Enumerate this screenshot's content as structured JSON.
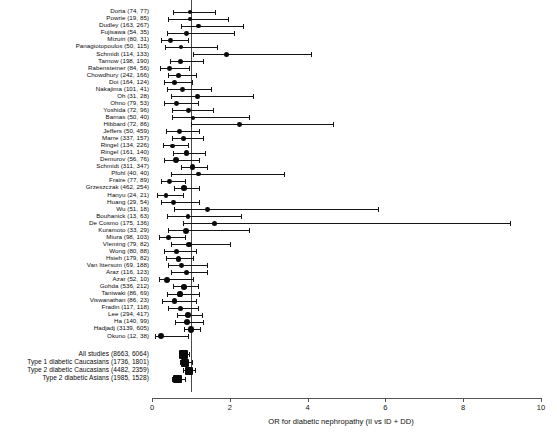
{
  "chart_data": {
    "type": "forest",
    "title": "",
    "xlabel": "OR for diabetic nephropathy (II vs ID + DD)",
    "ylabel": "",
    "xlim": [
      0,
      10
    ],
    "xticks": [
      0,
      2,
      4,
      6,
      8,
      10
    ],
    "xtick_labels": [
      "0",
      "2",
      "4",
      "6",
      "8",
      "10"
    ],
    "reference_line": 1,
    "grid": false,
    "legend": "none",
    "marker_shape": "filled-circle",
    "effect_measure": "Odds ratio",
    "studies": [
      {
        "label": "Dorta (74, 77)",
        "or": 0.98,
        "lcl": 0.55,
        "ucl": 1.62,
        "size": 2.2
      },
      {
        "label": "Powrie (19, 85)",
        "or": 0.97,
        "lcl": 0.42,
        "ucl": 1.95,
        "size": 2.2
      },
      {
        "label": "Dudley (163, 267)",
        "or": 1.2,
        "lcl": 0.74,
        "ucl": 2.35,
        "size": 2.4
      },
      {
        "label": "Fujisawa (54, 35)",
        "or": 0.88,
        "lcl": 0.38,
        "ucl": 2.1,
        "size": 2.4
      },
      {
        "label": "Mizuiri (80, 31)",
        "or": 0.48,
        "lcl": 0.22,
        "ucl": 0.92,
        "size": 2.4
      },
      {
        "label": "Panagiotopoulos (50, 115)",
        "or": 0.74,
        "lcl": 0.33,
        "ucl": 1.68,
        "size": 2.2
      },
      {
        "label": "Schmidt (114, 133)",
        "or": 1.92,
        "lcl": 1.06,
        "ucl": 4.1,
        "size": 2.6
      },
      {
        "label": "Tarnow (198, 190)",
        "or": 0.74,
        "lcl": 0.45,
        "ucl": 1.3,
        "size": 2.6
      },
      {
        "label": "Rabensteiner (84, 56)",
        "or": 0.45,
        "lcl": 0.21,
        "ucl": 0.96,
        "size": 2.4
      },
      {
        "label": "Chowdhury (242, 166)",
        "or": 0.68,
        "lcl": 0.42,
        "ucl": 1.12,
        "size": 2.6
      },
      {
        "label": "Doi (164, 124)",
        "or": 0.57,
        "lcl": 0.31,
        "ucl": 1.02,
        "size": 2.6
      },
      {
        "label": "Nakajima (101, 41)",
        "or": 0.78,
        "lcl": 0.38,
        "ucl": 1.52,
        "size": 2.4
      },
      {
        "label": "Oh (31, 28)",
        "or": 1.17,
        "lcl": 0.5,
        "ucl": 2.6,
        "size": 2.2
      },
      {
        "label": "Ohno (79, 53)",
        "or": 0.62,
        "lcl": 0.3,
        "ucl": 1.18,
        "size": 2.4
      },
      {
        "label": "Yoshida (72, 96)",
        "or": 0.93,
        "lcl": 0.52,
        "ucl": 1.58,
        "size": 2.4
      },
      {
        "label": "Barnas (50, 40)",
        "or": 1.05,
        "lcl": 0.52,
        "ucl": 2.5,
        "size": 2.2
      },
      {
        "label": "Hibbard (72, 86)",
        "or": 2.25,
        "lcl": 1.0,
        "ucl": 4.65,
        "size": 2.4
      },
      {
        "label": "Jeffers (50, 459)",
        "or": 0.7,
        "lcl": 0.35,
        "ucl": 1.2,
        "size": 2.4
      },
      {
        "label": "Marre (337, 157)",
        "or": 0.82,
        "lcl": 0.52,
        "ucl": 1.3,
        "size": 2.6
      },
      {
        "label": "Ringel (134, 226)",
        "or": 0.52,
        "lcl": 0.27,
        "ucl": 0.92,
        "size": 2.4
      },
      {
        "label": "Ringel (161, 140)",
        "or": 0.88,
        "lcl": 0.55,
        "ucl": 1.36,
        "size": 2.6
      },
      {
        "label": "Demurov (56, 76)",
        "or": 0.62,
        "lcl": 0.3,
        "ucl": 1.2,
        "size": 3.2
      },
      {
        "label": "Schmidt (311, 347)",
        "or": 1.04,
        "lcl": 0.74,
        "ucl": 1.42,
        "size": 2.8
      },
      {
        "label": "Pfohl (40, 40)",
        "or": 1.2,
        "lcl": 0.5,
        "ucl": 3.4,
        "size": 2.2
      },
      {
        "label": "Fraire (77, 89)",
        "or": 0.44,
        "lcl": 0.22,
        "ucl": 0.84,
        "size": 2.4
      },
      {
        "label": "Grzeszczak (462, 254)",
        "or": 0.82,
        "lcl": 0.56,
        "ucl": 1.2,
        "size": 2.8
      },
      {
        "label": "Hanyu (24, 21)",
        "or": 0.36,
        "lcl": 0.14,
        "ucl": 0.8,
        "size": 2.4
      },
      {
        "label": "Huang (29, 54)",
        "or": 0.55,
        "lcl": 0.24,
        "ucl": 1.2,
        "size": 2.4
      },
      {
        "label": "Wu (51, 18)",
        "or": 1.42,
        "lcl": 0.56,
        "ucl": 5.8,
        "size": 2.4
      },
      {
        "label": "Bouhanick (13, 63)",
        "or": 0.92,
        "lcl": 0.38,
        "ucl": 2.3,
        "size": 2.2
      },
      {
        "label": "De Cosmo (175, 136)",
        "or": 1.6,
        "lcl": 0.8,
        "ucl": 9.2,
        "size": 2.6
      },
      {
        "label": "Kuramoto (33, 29)",
        "or": 0.88,
        "lcl": 0.42,
        "ucl": 2.5,
        "size": 3.0
      },
      {
        "label": "Miura (98, 103)",
        "or": 0.42,
        "lcl": 0.18,
        "ucl": 0.84,
        "size": 2.6
      },
      {
        "label": "Vleming (79, 82)",
        "or": 0.95,
        "lcl": 0.5,
        "ucl": 2.0,
        "size": 2.8
      },
      {
        "label": "Wong (80, 88)",
        "or": 0.62,
        "lcl": 0.32,
        "ucl": 1.12,
        "size": 2.6
      },
      {
        "label": "Hsieh (179, 82)",
        "or": 0.68,
        "lcl": 0.36,
        "ucl": 1.05,
        "size": 2.8
      },
      {
        "label": "Van Ittersum (69, 188)",
        "or": 0.75,
        "lcl": 0.4,
        "ucl": 1.42,
        "size": 2.4
      },
      {
        "label": "Araz (116, 123)",
        "or": 0.88,
        "lcl": 0.48,
        "ucl": 1.42,
        "size": 2.6
      },
      {
        "label": "Azar (52, 10)",
        "or": 0.38,
        "lcl": 0.18,
        "ucl": 1.05,
        "size": 3.2
      },
      {
        "label": "Gohda (536, 212)",
        "or": 0.82,
        "lcl": 0.55,
        "ucl": 1.18,
        "size": 2.8
      },
      {
        "label": "Taniwaki (86, 69)",
        "or": 0.72,
        "lcl": 0.38,
        "ucl": 1.22,
        "size": 2.6
      },
      {
        "label": "Viswanathan (86, 23)",
        "or": 0.58,
        "lcl": 0.26,
        "ucl": 1.12,
        "size": 2.6
      },
      {
        "label": "Fradin (117, 118)",
        "or": 0.74,
        "lcl": 0.42,
        "ucl": 1.18,
        "size": 2.6
      },
      {
        "label": "Lee (294, 417)",
        "or": 0.92,
        "lcl": 0.64,
        "ucl": 1.28,
        "size": 2.8
      },
      {
        "label": "Ha (140, 99)",
        "or": 0.9,
        "lcl": 0.6,
        "ucl": 1.3,
        "size": 3.0
      },
      {
        "label": "Hadjadj (3139, 605)",
        "or": 1.0,
        "lcl": 0.82,
        "ucl": 1.24,
        "size": 3.4
      },
      {
        "label": "Okuno (12, 38)",
        "or": 0.24,
        "lcl": 0.08,
        "ucl": 0.92,
        "size": 3.0
      }
    ],
    "summaries": [
      {
        "label": "All studies (8663, 6064)",
        "or": 0.82,
        "lcl": 0.7,
        "ucl": 0.94,
        "size": 4.6
      },
      {
        "label": "Type 1 diabetic Caucasians (1736, 1801)",
        "or": 0.85,
        "lcl": 0.72,
        "ucl": 1.02,
        "size": 4.0
      },
      {
        "label": "Type 2 diabetic Caucasians (4482, 2359)",
        "or": 0.94,
        "lcl": 0.8,
        "ucl": 1.1,
        "size": 4.0
      },
      {
        "label": "Type 2 diabetic Asians (1985, 1528)",
        "or": 0.66,
        "lcl": 0.52,
        "ucl": 0.84,
        "size": 4.2
      }
    ]
  },
  "colors": {
    "marker": "#0a0a0a",
    "line": "#141414",
    "axis": "#555555",
    "reference": "#4a4a4a",
    "background": "#ffffff"
  }
}
